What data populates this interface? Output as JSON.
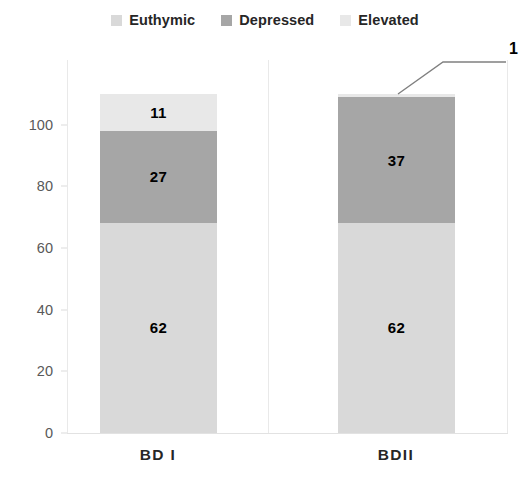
{
  "chart_data": {
    "type": "bar",
    "subtype": "stacked-bar",
    "title": "",
    "subtitle": "",
    "xlabel": "",
    "ylabel": "",
    "categories": [
      "BD I",
      "BDII"
    ],
    "series": [
      {
        "name": "Euthymic",
        "values": [
          62,
          62
        ],
        "color": "#d9d9d9"
      },
      {
        "name": "Depressed",
        "values": [
          27,
          37
        ],
        "color": "#a6a6a6"
      },
      {
        "name": "Elevated",
        "values": [
          11,
          1
        ],
        "color": "#e8e8e8"
      }
    ],
    "ylim": [
      0,
      110
    ],
    "yticks": [
      0,
      20,
      40,
      60,
      80,
      100
    ],
    "ytick_labels": [
      "0",
      "20",
      "40",
      "60",
      "80",
      "100"
    ],
    "grid": false,
    "legend_position": "top",
    "data_labels": [
      {
        "category": "BD I",
        "series": "Elevated",
        "value": "11",
        "placement": "inside"
      },
      {
        "category": "BD I",
        "series": "Depressed",
        "value": "27",
        "placement": "inside"
      },
      {
        "category": "BD I",
        "series": "Euthymic",
        "value": "62",
        "placement": "inside"
      },
      {
        "category": "BDII",
        "series": "Elevated",
        "value": "1",
        "placement": "callout"
      },
      {
        "category": "BDII",
        "series": "Depressed",
        "value": "37",
        "placement": "inside"
      },
      {
        "category": "BDII",
        "series": "Euthymic",
        "value": "62",
        "placement": "inside"
      }
    ],
    "annotations": [
      {
        "text": "1",
        "type": "leader-line",
        "target": "BDII Elevated segment"
      }
    ]
  },
  "legend": {
    "items": [
      {
        "label": "Euthymic",
        "color": "#d9d9d9"
      },
      {
        "label": "Depressed",
        "color": "#a6a6a6"
      },
      {
        "label": "Elevated",
        "color": "#e8e8e8"
      }
    ]
  },
  "y_axis": {
    "ticks": [
      "100",
      "80",
      "60",
      "40",
      "20",
      "0"
    ]
  },
  "x_axis": {
    "labels": [
      "BD I",
      "BDII"
    ]
  },
  "bars": {
    "bd1": {
      "elevated_value": "11",
      "depressed_value": "27",
      "euthymic_value": "62"
    },
    "bd2": {
      "elevated_value": "1",
      "depressed_value": "37",
      "euthymic_value": "62"
    }
  }
}
